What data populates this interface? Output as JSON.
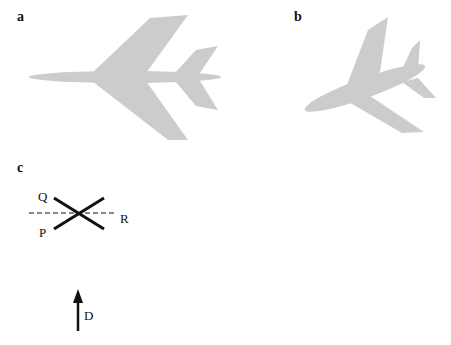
{
  "panels": {
    "a": {
      "label": "a"
    },
    "b": {
      "label": "b"
    },
    "c": {
      "label": "c"
    }
  },
  "diagram_c": {
    "labels": {
      "q": "Q",
      "p": "P",
      "r": "R",
      "d": "D"
    }
  },
  "colors": {
    "aircraft_fill": "#cccccc",
    "line": "#111111"
  }
}
